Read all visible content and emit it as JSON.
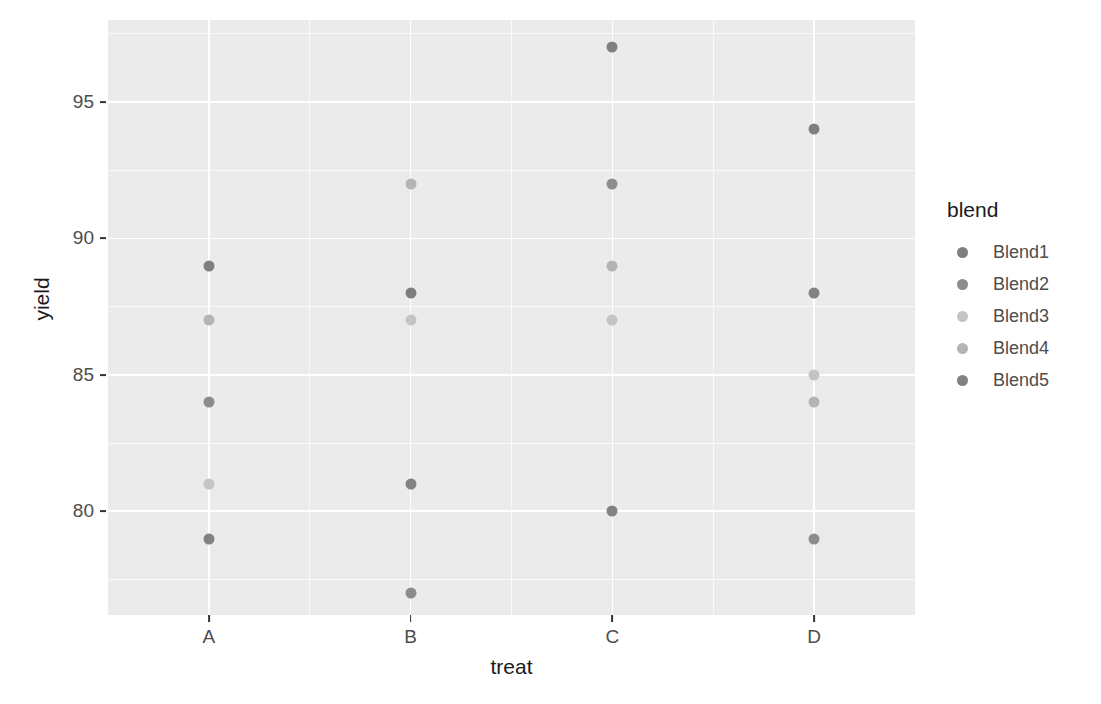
{
  "chart_data": {
    "type": "scatter",
    "title": "",
    "xlabel": "treat",
    "ylabel": "yield",
    "categories": [
      "A",
      "B",
      "C",
      "D"
    ],
    "x_tick_labels": [
      "A",
      "B",
      "C",
      "D"
    ],
    "y_tick_labels": [
      "80",
      "85",
      "90",
      "95"
    ],
    "y_ticks": [
      80,
      85,
      90,
      95
    ],
    "ylim": [
      76.2,
      98.0
    ],
    "grid": true,
    "grid_minor": true,
    "legend_position": "right",
    "legend_title": "blend",
    "series": [
      {
        "name": "Blend1",
        "color": "#7f7f7f",
        "points": [
          {
            "treat": "A",
            "yield": 89
          },
          {
            "treat": "B",
            "yield": 88
          },
          {
            "treat": "C",
            "yield": 97
          },
          {
            "treat": "D",
            "yield": 94
          }
        ]
      },
      {
        "name": "Blend2",
        "color": "#8c8c8c",
        "points": [
          {
            "treat": "A",
            "yield": 84
          },
          {
            "treat": "B",
            "yield": 77
          },
          {
            "treat": "C",
            "yield": 92
          },
          {
            "treat": "D",
            "yield": 79
          }
        ]
      },
      {
        "name": "Blend3",
        "color": "#c4c4c4",
        "points": [
          {
            "treat": "A",
            "yield": 81
          },
          {
            "treat": "B",
            "yield": 87
          },
          {
            "treat": "C",
            "yield": 87
          },
          {
            "treat": "D",
            "yield": 85
          }
        ]
      },
      {
        "name": "Blend4",
        "color": "#b4b4b4",
        "points": [
          {
            "treat": "A",
            "yield": 87
          },
          {
            "treat": "B",
            "yield": 92
          },
          {
            "treat": "C",
            "yield": 89
          },
          {
            "treat": "D",
            "yield": 84
          }
        ]
      },
      {
        "name": "Blend5",
        "color": "#828282",
        "points": [
          {
            "treat": "A",
            "yield": 79
          },
          {
            "treat": "B",
            "yield": 81
          },
          {
            "treat": "C",
            "yield": 80
          },
          {
            "treat": "D",
            "yield": 88
          }
        ]
      }
    ],
    "all_points": [
      {
        "treat": "A",
        "yield": 89,
        "blend": "Blend1"
      },
      {
        "treat": "A",
        "yield": 87,
        "blend": "Blend4"
      },
      {
        "treat": "A",
        "yield": 84,
        "blend": "Blend2"
      },
      {
        "treat": "A",
        "yield": 81,
        "blend": "Blend3"
      },
      {
        "treat": "A",
        "yield": 79,
        "blend": "Blend5"
      },
      {
        "treat": "B",
        "yield": 92,
        "blend": "Blend4"
      },
      {
        "treat": "B",
        "yield": 88,
        "blend": "Blend1"
      },
      {
        "treat": "B",
        "yield": 87,
        "blend": "Blend3"
      },
      {
        "treat": "B",
        "yield": 81,
        "blend": "Blend5"
      },
      {
        "treat": "B",
        "yield": 77,
        "blend": "Blend2"
      },
      {
        "treat": "C",
        "yield": 97,
        "blend": "Blend1"
      },
      {
        "treat": "C",
        "yield": 92,
        "blend": "Blend2"
      },
      {
        "treat": "C",
        "yield": 89,
        "blend": "Blend4"
      },
      {
        "treat": "C",
        "yield": 87,
        "blend": "Blend3"
      },
      {
        "treat": "C",
        "yield": 80,
        "blend": "Blend5"
      },
      {
        "treat": "D",
        "yield": 94,
        "blend": "Blend1"
      },
      {
        "treat": "D",
        "yield": 88,
        "blend": "Blend5"
      },
      {
        "treat": "D",
        "yield": 85,
        "blend": "Blend3"
      },
      {
        "treat": "D",
        "yield": 84,
        "blend": "Blend4"
      },
      {
        "treat": "D",
        "yield": 79,
        "blend": "Blend2"
      }
    ]
  },
  "legend": {
    "title": "blend",
    "items": [
      {
        "label": "Blend1",
        "color": "#7f7f7f"
      },
      {
        "label": "Blend2",
        "color": "#8c8c8c"
      },
      {
        "label": "Blend3",
        "color": "#c4c4c4"
      },
      {
        "label": "Blend4",
        "color": "#b4b4b4"
      },
      {
        "label": "Blend5",
        "color": "#828282"
      }
    ]
  },
  "axes": {
    "x_title": "treat",
    "y_title": "yield"
  },
  "theme": {
    "panel_background": "#ebebeb",
    "grid_color": "#ffffff",
    "text_color": "#4d4d4d",
    "title_color": "#1a1a1a"
  }
}
